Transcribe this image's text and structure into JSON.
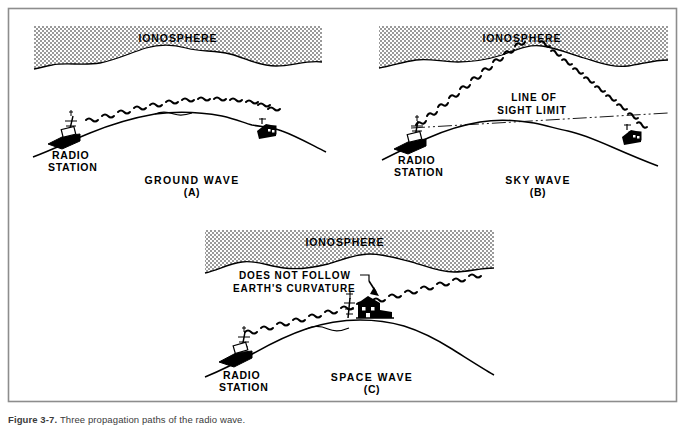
{
  "figure": {
    "border_color": "#8d8d8d",
    "ink_color": "#000000",
    "background": "#ffffff",
    "ionosphere_fill": "#b8b8b8",
    "caption_label": "Figure 3-7.",
    "caption_text": "Three propagation paths of the radio wave."
  },
  "panels": [
    {
      "id": "a",
      "ionosphere_label": "IONOSPHERE",
      "station_label_line1": "RADIO",
      "station_label_line2": "STATION",
      "title": "GROUND WAVE",
      "letter": "(A)",
      "annotations": []
    },
    {
      "id": "b",
      "ionosphere_label": "IONOSPHERE",
      "station_label_line1": "RADIO",
      "station_label_line2": "STATION",
      "title": "SKY WAVE",
      "letter": "(B)",
      "annotations": [
        {
          "line1": "LINE OF",
          "line2": "SIGHT LIMIT"
        }
      ]
    },
    {
      "id": "c",
      "ionosphere_label": "IONOSPHERE",
      "station_label_line1": "RADIO",
      "station_label_line2": "STATION",
      "title": "SPACE WAVE",
      "letter": "(C)",
      "annotations": [
        {
          "line1": "DOES NOT FOLLOW",
          "line2": "EARTH'S CURVATURE"
        }
      ]
    }
  ]
}
